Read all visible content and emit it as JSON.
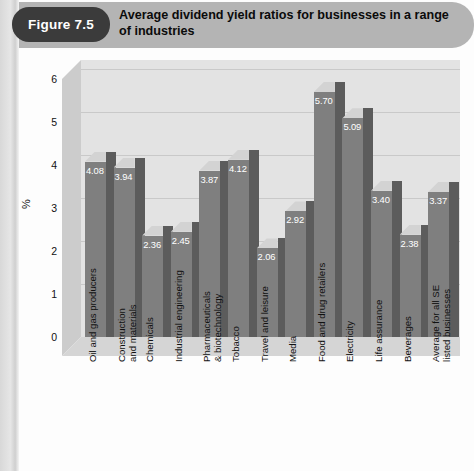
{
  "figure": {
    "badge": "Figure 7.5",
    "title": "Average dividend yield ratios for businesses in a range of industries"
  },
  "chart_data": {
    "type": "bar",
    "title": "Average dividend yield ratios for businesses in a range of industries",
    "xlabel": "",
    "ylabel": "%",
    "ylim": [
      0,
      6
    ],
    "yticks": [
      0,
      1,
      2,
      3,
      4,
      5,
      6
    ],
    "grid": true,
    "legend": null,
    "three_d": true,
    "categories": [
      "Oil and gas producers",
      "Construction and materials",
      "Chemicals",
      "Industrial engineering",
      "Pharmaceuticals & biotechnology",
      "Tobacco",
      "Travel and leisure",
      "Media",
      "Food and drug retailers",
      "Electricity",
      "Life assurance",
      "Beverages",
      "Average for all SE listed businesses"
    ],
    "category_lines": [
      [
        "Oil and gas producers"
      ],
      [
        "Construction",
        "and materials"
      ],
      [
        "Chemicals"
      ],
      [
        "Industrial engineering"
      ],
      [
        "Pharmaceuticals",
        "& biotechnology"
      ],
      [
        "Tobacco"
      ],
      [
        "Travel and leisure"
      ],
      [
        "Media"
      ],
      [
        "Food and drug retailers"
      ],
      [
        "Electricity"
      ],
      [
        "Life assurance"
      ],
      [
        "Beverages"
      ],
      [
        "Average for all SE",
        "listed businesses"
      ]
    ],
    "values": [
      4.08,
      3.94,
      2.36,
      2.45,
      3.87,
      4.12,
      2.06,
      2.92,
      5.7,
      5.09,
      3.4,
      2.38,
      3.37
    ],
    "value_labels": [
      "4.08",
      "3.94",
      "2.36",
      "2.45",
      "3.87",
      "4.12",
      "2.06",
      "2.92",
      "5.70",
      "5.09",
      "3.40",
      "2.38",
      "3.37"
    ],
    "colors": {
      "bar_front": "#7f7f7f",
      "bar_top": "#d3d3d3",
      "bar_side": "#5c5c5c",
      "plot_back": "#e3e3e3",
      "plot_floor": "#d5d5d5",
      "header_band": "#b4b4b4",
      "badge": "#3b3b3b"
    }
  }
}
